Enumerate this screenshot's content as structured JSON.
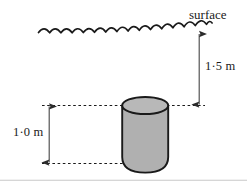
{
  "figure": {
    "canvas": {
      "width": 247,
      "height": 185,
      "background": "#ffffff"
    }
  },
  "labels": {
    "surface": "surface",
    "depth_to_top": "1·5 m",
    "cylinder_height": "1·0 m"
  },
  "measurements": [
    {
      "name": "depth-to-cylinder-top",
      "label": "1·5 m",
      "value": 1.5,
      "unit": "m",
      "from": "water surface",
      "to": "top of cylinder"
    },
    {
      "name": "cylinder-height",
      "label": "1·0 m",
      "value": 1.0,
      "unit": "m",
      "from": "top of cylinder",
      "to": "bottom of cylinder"
    }
  ],
  "elements": {
    "water_surface": {
      "name": "water-surface-wavy-line",
      "style": "scalloped wave",
      "stroke": "#1a1a1a"
    },
    "cylinder": {
      "name": "cylinder",
      "body_fill": "#b0b0b0",
      "top_fill": "#b8b8b8",
      "stroke": "#1a1a1a"
    },
    "guide_lines": {
      "name": "dashed-guide-lines",
      "style": "dashed",
      "stroke": "#1a1a1a"
    },
    "dimension_arrows": {
      "name": "double-headed-dimension-arrows",
      "stroke": "#4d4d4d"
    },
    "frame": {
      "name": "bottom-frame-rule",
      "stroke": "#c8c8c8"
    }
  },
  "colors": {
    "ink": "#1a1a1a",
    "cylinder_gray": "#b0b0b0",
    "cylinder_top_gray": "#b8b8b8",
    "arrow_gray": "#4d4d4d",
    "frame_gray": "#c8c8c8",
    "background": "#ffffff"
  }
}
